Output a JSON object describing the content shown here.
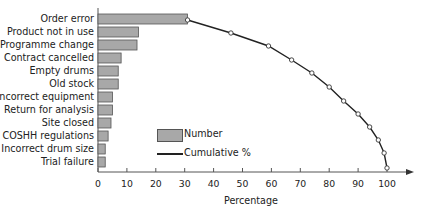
{
  "chart_data": {
    "type": "bar",
    "orientation": "horizontal",
    "title": "",
    "xlabel": "Percentage",
    "ylabel": "",
    "xlim": [
      0,
      105
    ],
    "x_ticks": [
      0,
      10,
      20,
      30,
      40,
      50,
      60,
      70,
      80,
      90,
      100
    ],
    "grid": false,
    "legend_position": "center",
    "categories": [
      "Order error",
      "Product not in use",
      "Programme change",
      "Contract cancelled",
      "Empty drums",
      "Old stock",
      "Incorrect equipment",
      "Return for analysis",
      "Site closed",
      "COSHH regulations",
      "Incorrect drum size",
      "Trial failure"
    ],
    "series": [
      {
        "name": "Number",
        "type": "bar",
        "color": "#a8a8a8",
        "values": [
          31,
          14,
          13.5,
          8,
          7,
          7,
          5,
          5,
          4.5,
          3.5,
          2.5,
          2.5
        ]
      },
      {
        "name": "Cumulative %",
        "type": "line",
        "color": "#222222",
        "values": [
          31,
          46,
          59,
          67,
          74,
          80,
          85,
          90,
          94,
          97,
          99,
          100
        ]
      }
    ]
  },
  "legend": {
    "number_label": "Number",
    "cumulative_label": "Cumulative %"
  },
  "axis": {
    "x_title": "Percentage",
    "tick_labels": [
      "0",
      "10",
      "20",
      "30",
      "40",
      "50",
      "60",
      "70",
      "80",
      "90",
      "100"
    ]
  }
}
